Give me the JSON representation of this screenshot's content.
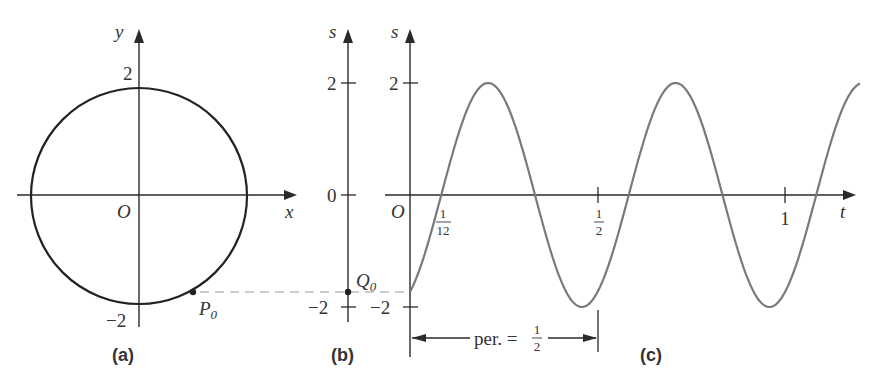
{
  "panels": {
    "a": {
      "caption": "(a)",
      "x_axis_label": "x",
      "y_axis_label": "y",
      "origin_label": "O",
      "tick_top": "2",
      "tick_bottom": "−2",
      "point_label": "P",
      "point_subscript": "0"
    },
    "b": {
      "caption": "(b)",
      "axis_label": "s",
      "tick_top": "2",
      "tick_mid": "0",
      "tick_bottom": "−2",
      "point_label": "Q",
      "point_subscript": "0"
    },
    "c": {
      "caption": "(c)",
      "axis_label": "s",
      "t_axis_label": "t",
      "origin_label": "O",
      "tick_top": "2",
      "tick_bottom": "−2",
      "t_ticks": [
        {
          "num": "1",
          "den": "12"
        },
        {
          "num": "1",
          "den": "2"
        },
        {
          "label": "1"
        }
      ],
      "period_label": "per. =",
      "period_num": "1",
      "period_den": "2"
    }
  },
  "colors": {
    "axes": "#2a2a2a",
    "circle": "#222222",
    "curve": "#7a7a7a",
    "dashed": "#9a9a9a"
  },
  "chart_data": {
    "type": "line",
    "title": "",
    "function": "s = 2 sin(4πt − π/3)",
    "amplitude": 2,
    "period": 0.5,
    "xlabel": "t",
    "ylabel": "s",
    "xlim": [
      0,
      1.2
    ],
    "ylim": [
      -2,
      2
    ],
    "x_ticks": [
      "1/12",
      "1/2",
      "1"
    ],
    "y_ticks": [
      "2",
      "0",
      "−2"
    ],
    "initial_value": -1.732,
    "zero_crossings": [
      0.0833,
      0.3333,
      0.5833,
      0.8333,
      1.0833
    ],
    "maxima": [
      {
        "t": 0.2083,
        "s": 2
      },
      {
        "t": 0.7083,
        "s": 2
      }
    ],
    "minima": [
      {
        "t": 0.4583,
        "s": -2
      },
      {
        "t": 0.9583,
        "s": -2
      }
    ],
    "circle": {
      "radius": 2,
      "center": [
        0,
        0
      ],
      "P0_angle_deg": -60
    }
  }
}
